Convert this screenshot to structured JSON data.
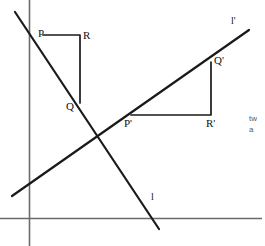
{
  "figure": {
    "background_color": "#ffffff",
    "stroke_color": "#1a1a1a",
    "axis_color": "#6b6b6b",
    "width": 265,
    "height": 246
  },
  "axes": {
    "y_axis": {
      "name": "vertical-axis",
      "x": 29,
      "y1": 0,
      "y2": 246
    },
    "x_axis": {
      "name": "horizontal-axis",
      "y": 218,
      "x1": 0,
      "x2": 262
    }
  },
  "lines": [
    {
      "id": "line-l",
      "label": "l",
      "label_x": 151,
      "label_y": 192,
      "x1": 15,
      "y1": 12,
      "x2": 159,
      "y2": 229,
      "description": "original line with negative slope"
    },
    {
      "id": "line-l-prime",
      "label": "l'",
      "label_x": 231,
      "label_y": 16,
      "x1": 12,
      "y1": 196,
      "x2": 249,
      "y2": 30,
      "description": "image line with positive slope"
    }
  ],
  "triangles": [
    {
      "id": "triangle-pqr",
      "vertices": [
        {
          "label": "P",
          "x": 43,
          "y": 35,
          "label_x": 38,
          "label_y": 28
        },
        {
          "label": "R",
          "x": 80,
          "y": 35,
          "label_x": 83,
          "label_y": 30
        },
        {
          "label": "Q",
          "x": 80,
          "y": 103,
          "label_x": 66,
          "label_y": 101
        }
      ],
      "edges": [
        {
          "from": "P",
          "to": "R",
          "kind": "horizontal-run"
        },
        {
          "from": "R",
          "to": "Q",
          "kind": "vertical-rise"
        }
      ]
    },
    {
      "id": "triangle-p-prime-q-prime-r-prime",
      "vertices": [
        {
          "label": "P'",
          "x": 131,
          "y": 115,
          "label_x": 124,
          "label_y": 118
        },
        {
          "label": "R'",
          "x": 211,
          "y": 115,
          "label_x": 206,
          "label_y": 118
        },
        {
          "label": "Q'",
          "x": 211,
          "y": 62,
          "label_x": 214,
          "label_y": 55
        }
      ],
      "edges": [
        {
          "from": "P'",
          "to": "R'",
          "kind": "horizontal-run"
        },
        {
          "from": "R'",
          "to": "Q'",
          "kind": "vertical-rise"
        }
      ]
    }
  ],
  "side_note": {
    "line1": "tw",
    "line2": "a",
    "x": 249,
    "y": 113
  }
}
